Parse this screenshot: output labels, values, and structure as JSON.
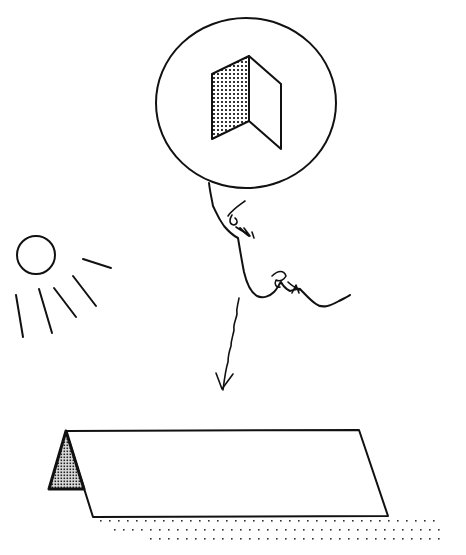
{
  "figure": {
    "title": "",
    "colors": {
      "ink": "#111111",
      "background": "#ffffff",
      "shade": "#555555"
    },
    "elements": {
      "thought_bubble": {
        "label": "imagined folded panel (thought bubble)"
      },
      "face_profile": {
        "label": "human face profile"
      },
      "sun": {
        "label": "sun with rays",
        "ray_count": 5
      },
      "arrow": {
        "label": "downward arrow"
      },
      "tent": {
        "label": "A-frame tent / folded structure on ground"
      },
      "ground": {
        "label": "dotted ground texture"
      }
    }
  }
}
